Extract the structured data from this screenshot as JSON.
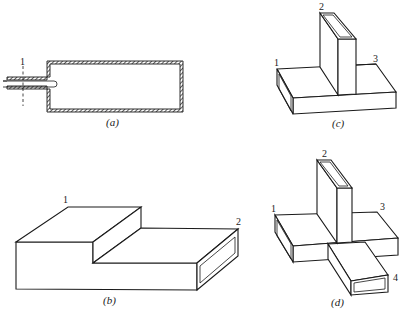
{
  "figure": {
    "panels": [
      {
        "id": "a",
        "caption": "(a)",
        "description": "Cross-section of a rectangular cavity with hatched walls fed by a coaxial probe on the left",
        "port_labels": [
          "1"
        ]
      },
      {
        "id": "b",
        "caption": "(b)",
        "description": "Waveguide step (E-plane step) with two ports",
        "port_labels": [
          "1",
          "2"
        ]
      },
      {
        "id": "c",
        "caption": "(c)",
        "description": "Waveguide T-junction with three ports",
        "port_labels": [
          "1",
          "2",
          "3"
        ]
      },
      {
        "id": "d",
        "caption": "(d)",
        "description": "Waveguide four-port junction (magic-T / hybrid junction)",
        "port_labels": [
          "1",
          "2",
          "3",
          "4"
        ]
      }
    ],
    "colors": {
      "ink": "#1a1a1a",
      "background": "#ffffff"
    }
  }
}
